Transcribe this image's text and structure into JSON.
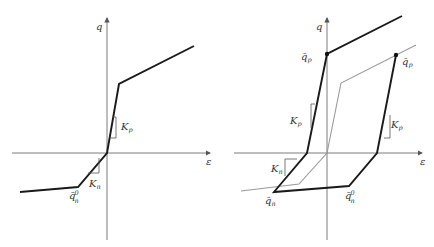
{
  "figure": {
    "left_panel": {
      "axes": {
        "x_label": "ε",
        "y_label": "q"
      },
      "labels": {
        "kp": "K",
        "kp_sub": "p",
        "kn": "K",
        "kn_sub": "n",
        "qn0": "q̄",
        "qn0_sub": "n",
        "qn0_sup": "0"
      }
    },
    "right_panel": {
      "axes": {
        "x_label": "ε",
        "y_label": "q"
      },
      "labels": {
        "qp_left": "q̄",
        "qp_left_sub": "p",
        "qp_right": "q̄",
        "qp_right_sub": "p",
        "kp_left": "K",
        "kp_left_sub": "p",
        "kp_right": "K",
        "kp_right_sub": "p",
        "kn": "K",
        "kn_sub": "n",
        "qn": "q̄",
        "qn_sub": "n",
        "qn0": "q̄",
        "qn0_sub": "n",
        "qn0_sup": "0"
      }
    },
    "colors": {
      "bold_curve": "#1a1a1a",
      "grey_curve": "#9a9a9a",
      "axis": "#6e6e6e"
    }
  }
}
